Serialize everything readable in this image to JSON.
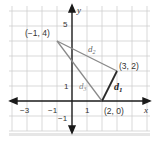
{
  "diagram": {
    "type": "coordinate-plane-triangle",
    "axes": {
      "x_label": "x",
      "y_label": "y",
      "x_ticks": [
        "−3",
        "−1",
        "1"
      ],
      "y_ticks": [
        "5",
        "1",
        "−1"
      ]
    },
    "points": [
      {
        "id": "A",
        "label": "(−1, 4)",
        "x": -1,
        "y": 4
      },
      {
        "id": "B",
        "label": "(3, 2)",
        "x": 3,
        "y": 2
      },
      {
        "id": "C",
        "label": "(2, 0)",
        "x": 2,
        "y": 0
      }
    ],
    "segments": [
      {
        "name": "d",
        "sub": "1",
        "from": "C",
        "to": "B",
        "emphasis": "bold"
      },
      {
        "name": "d",
        "sub": "2",
        "from": "A",
        "to": "B",
        "emphasis": "normal"
      },
      {
        "name": "d",
        "sub": "3",
        "from": "A",
        "to": "C",
        "emphasis": "normal"
      }
    ],
    "colors": {
      "grid": "#cfcfcf",
      "axis": "#1a1a1a",
      "segment": "#8a8a8a",
      "segment_bold": "#2a2a2a",
      "text": "#333333"
    }
  }
}
